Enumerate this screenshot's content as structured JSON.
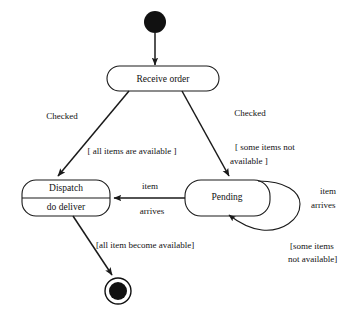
{
  "diagram": {
    "type": "uml-state-diagram",
    "colors": {
      "background": "#ffffff",
      "stroke": "#1a1a1a",
      "node_fill": "#111111",
      "text": "#111111"
    },
    "states": {
      "initial": {
        "name": "initial-state",
        "label": ""
      },
      "receive_order": {
        "label": "Receive  order"
      },
      "dispatch": {
        "label": "Dispatch",
        "activity": "do deliver"
      },
      "pending": {
        "label": "Pending"
      },
      "final": {
        "name": "final-state",
        "label": ""
      }
    },
    "transitions": {
      "initial_to_receive": {
        "label": ""
      },
      "receive_to_dispatch": {
        "event": "Checked",
        "guard": "[ all items are available ]"
      },
      "receive_to_pending": {
        "event": "Checked",
        "guard_line1": "[ some items not",
        "guard_line2": "available ]"
      },
      "pending_to_dispatch": {
        "event_line1": "item",
        "event_line2": "arrives"
      },
      "pending_self_loop": {
        "event_line1": "item",
        "event_line2": "arrives",
        "guard_line1": "[some items",
        "guard_line2": "not available]"
      },
      "dispatch_to_final": {
        "guard": "[all item become available]"
      }
    }
  }
}
